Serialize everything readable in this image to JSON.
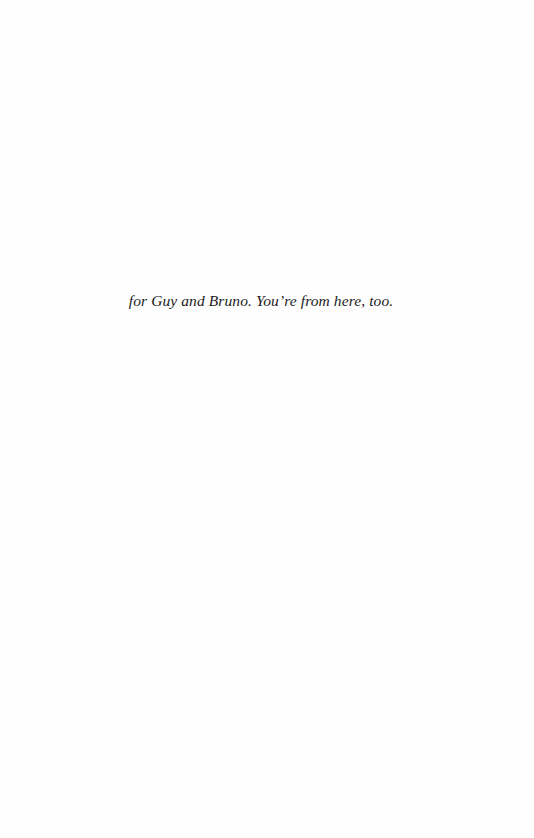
{
  "page": {
    "dedication": "for Guy and Bruno. You’re from here, too."
  }
}
